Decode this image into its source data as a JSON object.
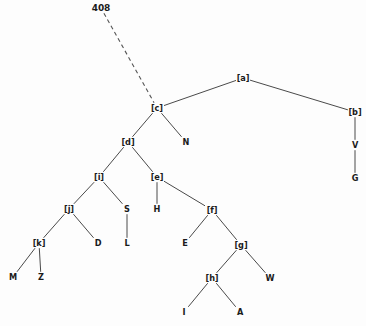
{
  "diagram": {
    "type": "tree",
    "title_label": "408",
    "background_color": "#fdfdfd",
    "edge_color": "#4a4a4a",
    "text_color": "#1b1b1b",
    "width": 366,
    "height": 326,
    "nodes": [
      {
        "id": "root",
        "label": "408",
        "x": 101,
        "y": 8,
        "kind": "root-tag"
      },
      {
        "id": "a",
        "label": "[a]",
        "x": 243,
        "y": 78,
        "kind": "internal"
      },
      {
        "id": "c",
        "label": "[c]",
        "x": 157,
        "y": 108,
        "kind": "internal"
      },
      {
        "id": "b",
        "label": "[b]",
        "x": 355,
        "y": 112,
        "kind": "internal"
      },
      {
        "id": "d",
        "label": "[d]",
        "x": 128,
        "y": 142,
        "kind": "internal"
      },
      {
        "id": "N",
        "label": "N",
        "x": 186,
        "y": 142,
        "kind": "leaf"
      },
      {
        "id": "V",
        "label": "V",
        "x": 355,
        "y": 145,
        "kind": "leaf"
      },
      {
        "id": "i",
        "label": "[i]",
        "x": 99,
        "y": 177,
        "kind": "internal"
      },
      {
        "id": "e",
        "label": "[e]",
        "x": 157,
        "y": 177,
        "kind": "internal"
      },
      {
        "id": "G",
        "label": "G",
        "x": 355,
        "y": 178,
        "kind": "leaf"
      },
      {
        "id": "j",
        "label": "[j]",
        "x": 69,
        "y": 209,
        "kind": "internal"
      },
      {
        "id": "S",
        "label": "S",
        "x": 127,
        "y": 209,
        "kind": "internal"
      },
      {
        "id": "H",
        "label": "H",
        "x": 157,
        "y": 209,
        "kind": "leaf"
      },
      {
        "id": "f",
        "label": "[f]",
        "x": 212,
        "y": 210,
        "kind": "internal"
      },
      {
        "id": "k",
        "label": "[k]",
        "x": 39,
        "y": 243,
        "kind": "internal"
      },
      {
        "id": "D",
        "label": "D",
        "x": 98,
        "y": 243,
        "kind": "leaf"
      },
      {
        "id": "L",
        "label": "L",
        "x": 127,
        "y": 243,
        "kind": "leaf"
      },
      {
        "id": "E",
        "label": "E",
        "x": 185,
        "y": 243,
        "kind": "leaf"
      },
      {
        "id": "g",
        "label": "[g]",
        "x": 241,
        "y": 245,
        "kind": "internal"
      },
      {
        "id": "M",
        "label": "M",
        "x": 13,
        "y": 277,
        "kind": "leaf"
      },
      {
        "id": "Z",
        "label": "Z",
        "x": 41,
        "y": 277,
        "kind": "leaf"
      },
      {
        "id": "h",
        "label": "[h]",
        "x": 212,
        "y": 278,
        "kind": "internal"
      },
      {
        "id": "W",
        "label": "W",
        "x": 270,
        "y": 278,
        "kind": "leaf"
      },
      {
        "id": "I",
        "label": "I",
        "x": 184,
        "y": 312,
        "kind": "leaf"
      },
      {
        "id": "A",
        "label": "A",
        "x": 240,
        "y": 312,
        "kind": "leaf"
      }
    ],
    "edges": [
      {
        "from": "root",
        "to": "c",
        "style": "dashed"
      },
      {
        "from": "c",
        "to": "a",
        "style": "solid"
      },
      {
        "from": "a",
        "to": "b",
        "style": "solid"
      },
      {
        "from": "b",
        "to": "V",
        "style": "solid"
      },
      {
        "from": "V",
        "to": "G",
        "style": "solid"
      },
      {
        "from": "c",
        "to": "d",
        "style": "solid"
      },
      {
        "from": "c",
        "to": "N",
        "style": "solid"
      },
      {
        "from": "d",
        "to": "i",
        "style": "solid"
      },
      {
        "from": "d",
        "to": "e",
        "style": "solid"
      },
      {
        "from": "i",
        "to": "j",
        "style": "solid"
      },
      {
        "from": "i",
        "to": "S",
        "style": "solid"
      },
      {
        "from": "S",
        "to": "L",
        "style": "solid"
      },
      {
        "from": "j",
        "to": "k",
        "style": "solid"
      },
      {
        "from": "j",
        "to": "D",
        "style": "solid"
      },
      {
        "from": "k",
        "to": "M",
        "style": "solid"
      },
      {
        "from": "k",
        "to": "Z",
        "style": "solid"
      },
      {
        "from": "e",
        "to": "H",
        "style": "solid"
      },
      {
        "from": "e",
        "to": "f",
        "style": "solid"
      },
      {
        "from": "f",
        "to": "E",
        "style": "solid"
      },
      {
        "from": "f",
        "to": "g",
        "style": "solid"
      },
      {
        "from": "g",
        "to": "h",
        "style": "solid"
      },
      {
        "from": "g",
        "to": "W",
        "style": "solid"
      },
      {
        "from": "h",
        "to": "I",
        "style": "solid"
      },
      {
        "from": "h",
        "to": "A",
        "style": "solid"
      }
    ]
  }
}
